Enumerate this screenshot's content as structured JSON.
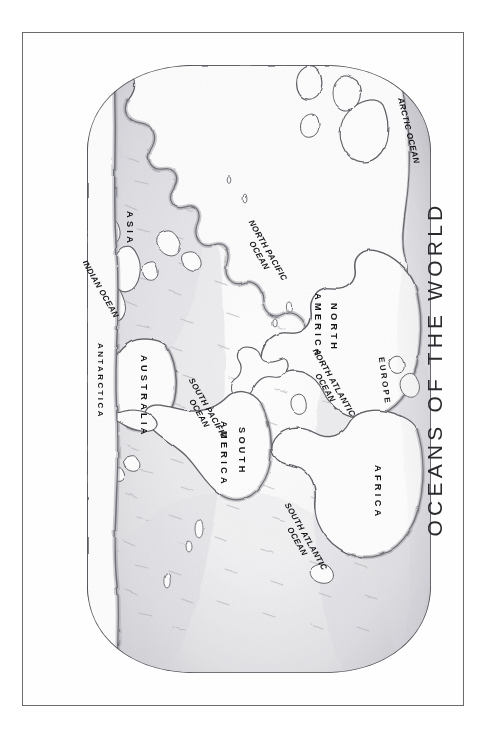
{
  "page": {
    "background_color": "#ffffff",
    "frame_color": "#6b6b6b"
  },
  "title": {
    "text": "OCEANS OF THE WORLD",
    "orientation": "rotated-90-ccw",
    "color": "#2a2a2e"
  },
  "map": {
    "style": "hand-drawn pencil sketch, graphite shading",
    "projection_shape": "rounded oval / stadium",
    "orientation": "landscape map rotated 90 degrees clockwise inside portrait frame",
    "centered_on": "Pacific Ocean",
    "ink_color": "#55555a",
    "shade_color": "#9a9a9f",
    "land_color": "#fdfdfd",
    "continents": [
      {
        "name": "ASIA",
        "style": "spaced-caps"
      },
      {
        "name": "EUROPE",
        "style": "spaced-caps-small"
      },
      {
        "name": "AFRICA",
        "style": "spaced-caps"
      },
      {
        "name": "NORTH",
        "style": "spaced-caps"
      },
      {
        "name": "AMERICA",
        "style": "spaced-caps"
      },
      {
        "name": "SOUTH",
        "style": "spaced-caps"
      },
      {
        "name": "AMERICA",
        "style": "spaced-caps"
      },
      {
        "name": "AUSTRALIA",
        "style": "spaced-caps"
      },
      {
        "name": "ANTARCTICA",
        "style": "spaced-caps-small"
      }
    ],
    "oceans": [
      {
        "name": "ARCTIC OCEAN",
        "line1": "ARCTIC OCEAN",
        "line2": ""
      },
      {
        "name": "NORTH ATLANTIC OCEAN",
        "line1": "NORTH ATLANTIC",
        "line2": "OCEAN"
      },
      {
        "name": "SOUTH ATLANTIC OCEAN",
        "line1": "SOUTH ATLANTIC",
        "line2": "OCEAN"
      },
      {
        "name": "NORTH PACIFIC OCEAN",
        "line1": "NORTH PACIFIC",
        "line2": "OCEAN"
      },
      {
        "name": "SOUTH PACIFIC OCEAN",
        "line1": "SOUTH PACIFIC",
        "line2": "OCEAN"
      },
      {
        "name": "INDIAN OCEAN",
        "line1": "INDIAN OCEAN",
        "line2": ""
      }
    ],
    "labels": {
      "asia": "ASIA",
      "europe": "EUROPE",
      "africa": "AFRICA",
      "north": "NORTH",
      "north_america_2": "AMERICA",
      "south": "SOUTH",
      "south_america_2": "AMERICA",
      "australia": "AUSTRALIA",
      "antarctica": "ANTARCTICA",
      "arctic_ocean": "ARCTIC OCEAN",
      "north_atlantic_1": "NORTH ATLANTIC",
      "north_atlantic_2": "OCEAN",
      "south_atlantic_1": "SOUTH ATLANTIC",
      "south_atlantic_2": "OCEAN",
      "north_pacific_1": "NORTH PACIFIC",
      "north_pacific_2": "OCEAN",
      "south_pacific_1": "SOUTH PACIFIC",
      "south_pacific_2": "OCEAN",
      "indian_ocean": "INDIAN OCEAN"
    }
  }
}
